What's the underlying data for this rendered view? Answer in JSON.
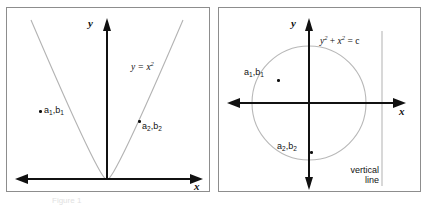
{
  "figure": {
    "name": "vertical-line-test-figure",
    "panels": [
      {
        "id": "left",
        "curve_label": "y = x",
        "curve_exponent": "2",
        "axis_x_label": "x",
        "axis_y_label": "y",
        "points": [
          {
            "label_a": "a",
            "sub_a": "1",
            "label_b": "b",
            "sub_b": "1",
            "comma": ","
          },
          {
            "label_a": "a",
            "sub_a": "2",
            "label_b": "b",
            "sub_b": "2",
            "comma": ","
          }
        ],
        "curve_color": "#b3b3b3",
        "axis_color": "#111111"
      },
      {
        "id": "right",
        "equation_y": "y",
        "equation_exp1": "2",
        "equation_plus": " + ",
        "equation_x": "x",
        "equation_exp2": "2",
        "equation_rhs": " = c",
        "axis_x_label": "x",
        "axis_y_label": "y",
        "points": [
          {
            "label_a": "a",
            "sub_a": "1",
            "label_b": "b",
            "sub_b": "1",
            "comma": ","
          },
          {
            "label_a": "a",
            "sub_a": "2",
            "label_b": "b",
            "sub_b": "2",
            "comma": ","
          }
        ],
        "note_line1": "vertical",
        "note_line2": "line",
        "circle_color": "#b8b8b8",
        "vertical_line_color": "#b8b8b8",
        "axis_color": "#111111"
      }
    ],
    "caption": "Figure 1"
  }
}
